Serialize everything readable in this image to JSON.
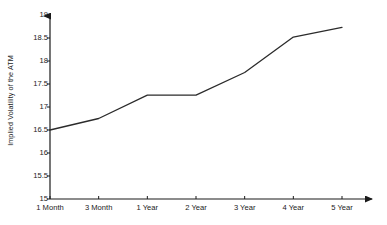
{
  "chart_data": {
    "type": "line",
    "title": "",
    "xlabel": "",
    "ylabel": "Implied Volatility of the ATM",
    "categories": [
      "1 Month",
      "3 Month",
      "1 Year",
      "2 Year",
      "3 Year",
      "4 Year",
      "5 Year"
    ],
    "values": [
      16.5,
      16.75,
      17.26,
      17.26,
      17.75,
      18.52,
      18.73
    ],
    "series": [
      {
        "name": "Implied Volatility of the ATM",
        "values": [
          16.5,
          16.75,
          17.26,
          17.26,
          17.75,
          18.52,
          18.73
        ]
      }
    ],
    "ylim": [
      15,
      19
    ],
    "ytick_labels": [
      "15",
      "15.5",
      "16",
      "16.5",
      "17",
      "17.5",
      "18",
      "18.5",
      "19"
    ],
    "ytick_values": [
      15,
      15.5,
      16,
      16.5,
      17,
      17.5,
      18,
      18.5,
      19
    ],
    "grid": false,
    "legend": false,
    "legend_position": "none",
    "line_color": "#2b2b2b",
    "axis_color": "#1a1a1a",
    "background_color": "#ffffff",
    "axis_arrows": true
  }
}
